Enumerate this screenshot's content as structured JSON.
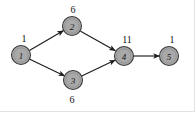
{
  "figure": {
    "type": "undirected-weighted-graph",
    "background_color": "#ffffff",
    "node_fill_color": "#a9a9a9",
    "node_stroke_color": "#3a3a3a",
    "edge_color": "#1c1c1c",
    "label_color": "#111111",
    "frame_color": "#e2e2e2"
  },
  "nodes": [
    {
      "id": "1",
      "label": "1",
      "label_value": "1",
      "label_position": "above",
      "cx": 21,
      "cy": 55,
      "r": 9.5
    },
    {
      "id": "2",
      "label": "2",
      "label_value": "6",
      "label_position": "above",
      "cx": 72,
      "cy": 26,
      "r": 9.5
    },
    {
      "id": "3",
      "label": "3",
      "label_value": "6",
      "label_position": "below",
      "cx": 73,
      "cy": 80,
      "r": 9.5
    },
    {
      "id": "4",
      "label": "4",
      "label_value": "11",
      "label_position": "above",
      "cx": 124,
      "cy": 56,
      "r": 9.5
    },
    {
      "id": "5",
      "label": "5",
      "label_value": "1",
      "label_position": "above",
      "cx": 169,
      "cy": 56,
      "r": 9.5
    }
  ],
  "node_value_labels": [
    {
      "node": "1",
      "text": "1",
      "x": 24,
      "y": 38
    },
    {
      "node": "2",
      "text": "6",
      "x": 73,
      "y": 9
    },
    {
      "node": "4",
      "text": "11",
      "x": 127,
      "y": 39
    },
    {
      "node": "5",
      "text": "1",
      "x": 172,
      "y": 39
    },
    {
      "node": "3",
      "text": "6",
      "x": 72,
      "y": 99
    }
  ],
  "edges": [
    {
      "from": "1",
      "to": "2",
      "arrows": "both"
    },
    {
      "from": "1",
      "to": "3",
      "arrows": "both"
    },
    {
      "from": "2",
      "to": "4",
      "arrows": "both"
    },
    {
      "from": "3",
      "to": "4",
      "arrows": "both"
    },
    {
      "from": "4",
      "to": "5",
      "arrows": "both"
    }
  ]
}
